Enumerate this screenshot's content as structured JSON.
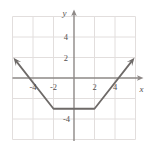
{
  "chart_data": {
    "type": "line",
    "title": "",
    "subtitle": "",
    "xlabel": "x",
    "ylabel": "y",
    "xlim": [
      -6,
      6
    ],
    "ylim": [
      -6,
      6
    ],
    "grid": true,
    "grid_step": 2,
    "legend": "none",
    "x_tick_labels": [
      "-4",
      "-2",
      "2",
      "4"
    ],
    "x_tick_values": [
      -4,
      -2,
      2,
      4
    ],
    "y_tick_labels": [
      "4",
      "2",
      "-4"
    ],
    "y_tick_values": [
      4,
      2,
      -4
    ],
    "annotations": [],
    "series": [
      {
        "name": "piecewise-trough",
        "description": "descending ray, flat segment, ascending ray",
        "x": [
          -5.6,
          -2,
          2,
          5.6
        ],
        "y": [
          1.6,
          -3,
          -3,
          1.6
        ],
        "arrow_start": true,
        "arrow_end": true,
        "color": "#6e6a68",
        "vertices": [
          [
            -2,
            -3
          ],
          [
            2,
            -3
          ]
        ],
        "x_intercepts": [
          -3.6,
          3.6
        ],
        "flat_level": -3
      }
    ]
  },
  "axes": {
    "x_axis_label": "x",
    "y_axis_label": "y",
    "x_axis_color": "#8d8886",
    "y_axis_color": "#8d8886",
    "grid_color": "#e2dedd",
    "plot_border_color": "#ddd9d8"
  },
  "colors": {
    "curve": "#6e6a68",
    "axis": "#8d8886",
    "grid": "#e2dedd",
    "text": "#55504f",
    "background": "#ffffff"
  }
}
